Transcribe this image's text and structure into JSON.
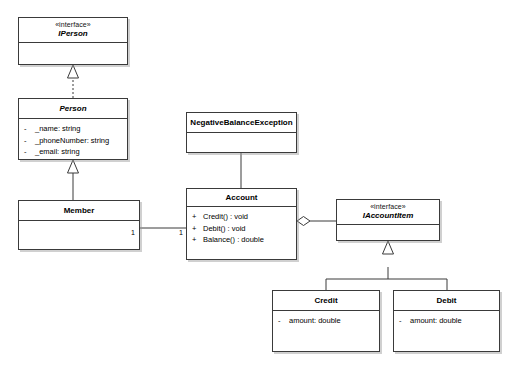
{
  "diagram": {
    "type": "uml-class-diagram",
    "background": "#ffffff",
    "line_color": "#3a3a3a"
  },
  "classes": {
    "iperson": {
      "stereotype": "«interface»",
      "name": "IPerson",
      "members": []
    },
    "person": {
      "stereotype": "",
      "name": "Person",
      "members": [
        {
          "visibility": "-",
          "signature": "_name:  string"
        },
        {
          "visibility": "-",
          "signature": "_phoneNumber:  string"
        },
        {
          "visibility": "-",
          "signature": "_email: string"
        }
      ]
    },
    "member": {
      "stereotype": "",
      "name": "Member",
      "members": []
    },
    "negative_balance_exception": {
      "stereotype": "",
      "name": "NegativeBalanceException",
      "members": []
    },
    "account": {
      "stereotype": "",
      "name": "Account",
      "members": [
        {
          "visibility": "+",
          "signature": "Credit() : void"
        },
        {
          "visibility": "+",
          "signature": "Debit() : void"
        },
        {
          "visibility": "+",
          "signature": "Balance() : double"
        }
      ]
    },
    "iaccountitem": {
      "stereotype": "«interface»",
      "name": "IAccountItem",
      "members": []
    },
    "credit": {
      "stereotype": "",
      "name": "Credit",
      "members": [
        {
          "visibility": "-",
          "signature": "amount:  double"
        }
      ]
    },
    "debit": {
      "stereotype": "",
      "name": "Debit",
      "members": [
        {
          "visibility": "-",
          "signature": "amount:  double"
        }
      ]
    }
  },
  "relationships": {
    "realization_person_iperson": {
      "kind": "realization",
      "from": "Person",
      "to": "IPerson",
      "line": "dashed",
      "arrow": "hollow-triangle"
    },
    "generalization_member_person": {
      "kind": "generalization",
      "from": "Member",
      "to": "Person",
      "line": "solid",
      "arrow": "hollow-triangle"
    },
    "association_account_exception": {
      "kind": "association",
      "from": "Account",
      "to": "NegativeBalanceException",
      "line": "solid",
      "arrow": "none"
    },
    "association_member_account": {
      "kind": "association",
      "from": "Member",
      "to": "Account",
      "line": "solid",
      "arrow": "none",
      "source_multiplicity": "1",
      "target_multiplicity": "1"
    },
    "aggregation_account_iaccountitem": {
      "kind": "aggregation",
      "from": "Account",
      "to": "IAccountItem",
      "line": "solid",
      "arrow": "hollow-diamond"
    },
    "generalization_credit_iaccountitem": {
      "kind": "generalization",
      "from": "Credit",
      "to": "IAccountItem",
      "line": "solid",
      "arrow": "hollow-triangle"
    },
    "generalization_debit_iaccountitem": {
      "kind": "generalization",
      "from": "Debit",
      "to": "IAccountItem",
      "line": "solid",
      "arrow": "hollow-triangle"
    }
  }
}
